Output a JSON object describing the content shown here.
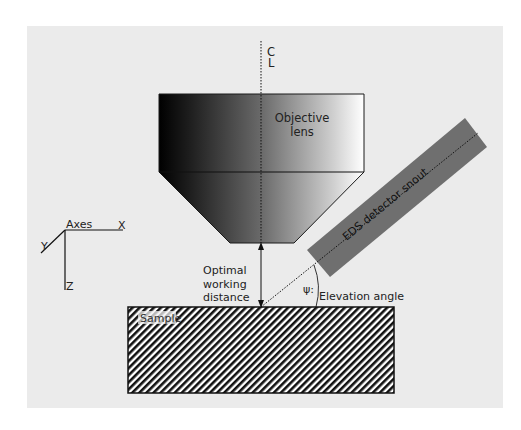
{
  "diagram": {
    "colors": {
      "page_background": "#ffffff",
      "panel_background": "#ebebeb",
      "detector_fill": "#6f6f6f",
      "line": "#1a1a1a",
      "lens_gradient_start": "#000000",
      "lens_gradient_end": "#ffffff"
    },
    "centerline": {
      "label_top": "C",
      "label_bottom": "L"
    },
    "objective_lens": {
      "label_line1": "Objective",
      "label_line2": "lens"
    },
    "detector": {
      "label": "EDS detector snout"
    },
    "working_distance": {
      "line1": "Optimal",
      "line2": "working",
      "line3": "distance"
    },
    "angle": {
      "symbol": "ψ:",
      "label": "Elevation angle"
    },
    "sample": {
      "label": "Sample"
    },
    "axes": {
      "title": "Axes",
      "x": "X",
      "y": "Y",
      "z": "Z"
    }
  }
}
